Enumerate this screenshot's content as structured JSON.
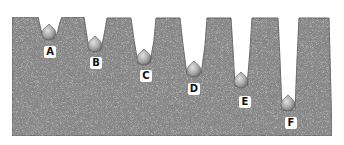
{
  "figure": {
    "colors": {
      "soil_fill": "#8a8a8a",
      "soil_speckle_dark": "#3a3a3a",
      "soil_speckle_light": "#d8d8d8",
      "bulb": "#b9b9b9",
      "bulb_shadow": "#7a7a7a",
      "background": "#ffffff"
    },
    "bulbs": [
      {
        "id": "A",
        "label": "A",
        "cx": 49,
        "cy": 32,
        "label_x": 44,
        "label_y": 47
      },
      {
        "id": "B",
        "label": "B",
        "cx": 95,
        "cy": 44,
        "label_x": 90,
        "label_y": 57
      },
      {
        "id": "C",
        "label": "C",
        "cx": 144,
        "cy": 57,
        "label_x": 140,
        "label_y": 70
      },
      {
        "id": "D",
        "label": "D",
        "cx": 194,
        "cy": 69,
        "label_x": 188,
        "label_y": 83
      },
      {
        "id": "E",
        "label": "E",
        "cx": 241,
        "cy": 80,
        "label_x": 239,
        "label_y": 96
      },
      {
        "id": "F",
        "label": "F",
        "cx": 288,
        "cy": 103,
        "label_x": 285,
        "label_y": 117
      }
    ]
  }
}
